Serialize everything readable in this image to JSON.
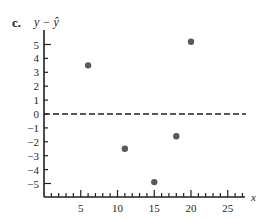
{
  "panel": {
    "label": "c.",
    "y_title": "y − ŷ"
  },
  "chart_data": {
    "type": "scatter",
    "title": "",
    "xlabel": "x",
    "ylabel": "y − ŷ",
    "xlim": [
      0,
      27
    ],
    "ylim": [
      -6,
      5.5
    ],
    "x_ticks": [
      5,
      10,
      15,
      20,
      25
    ],
    "y_ticks": [
      5,
      4,
      3,
      2,
      1,
      0,
      -1,
      -2,
      -3,
      -4,
      -5
    ],
    "reference_line": {
      "y": 0,
      "style": "dashed"
    },
    "grid": false,
    "legend": null,
    "points": [
      {
        "x": 6,
        "y": 3.5
      },
      {
        "x": 11,
        "y": -2.5
      },
      {
        "x": 15,
        "y": -4.9
      },
      {
        "x": 18,
        "y": -1.6
      },
      {
        "x": 20,
        "y": 5.2
      }
    ],
    "colors": {
      "axis": "#231f20",
      "point": "#58595b"
    }
  }
}
